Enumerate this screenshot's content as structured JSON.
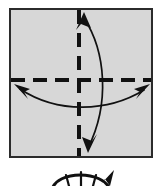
{
  "figure": {
    "caption": "Square sheet with horizontal and vertical valley creases and two double-headed curved fold arrows",
    "background_color": "#ffffff"
  },
  "paper": {
    "label": "square paper sheet",
    "shape": "square",
    "fill_color": "#d7d7d7",
    "border_color": "#2b2b2b",
    "border_width": 2,
    "x": 10,
    "y": 9,
    "width": 142,
    "height": 148
  },
  "creases": [
    {
      "name": "horizontal-crease",
      "type": "dashed",
      "orientation": "horizontal",
      "color": "#111111",
      "width": 4,
      "dash": "14 8",
      "x1": 11,
      "y1": 80,
      "x2": 151,
      "y2": 80
    },
    {
      "name": "vertical-crease",
      "type": "dashed",
      "orientation": "vertical",
      "color": "#111111",
      "width": 4,
      "dash": "14 9",
      "x1": 79,
      "y1": 10,
      "x2": 79,
      "y2": 156
    }
  ],
  "arrows": [
    {
      "name": "vertical-fold-arrow",
      "direction": "double-headed",
      "color": "#111111",
      "width": 1.7,
      "path": "M 84 18 C 106 52 110 104 88 148",
      "heads": [
        {
          "name": "arrowhead-top",
          "points": "84,12 91,28 81,24 76,30",
          "tip_x": 84,
          "tip_y": 12
        },
        {
          "name": "arrowhead-bottom",
          "points": "88,153 82,137 92,141 97,134",
          "tip_x": 88,
          "tip_y": 153
        }
      ]
    },
    {
      "name": "horizontal-fold-arrow",
      "direction": "double-headed",
      "color": "#111111",
      "width": 1.7,
      "path": "M 20 89 C 58 114 108 112 144 90",
      "heads": [
        {
          "name": "arrowhead-left",
          "points": "14,84 30,89 24,92 28,99",
          "tip_x": 14,
          "tip_y": 84
        },
        {
          "name": "arrowhead-right",
          "points": "150,84 134,89 140,92 136,99",
          "tip_x": 150,
          "tip_y": 84
        }
      ]
    }
  ],
  "next_step_preview": {
    "name": "next-step-partial",
    "description": "cropped top of following diagram: curved arc with radiating fold lines and arrowhead",
    "color": "#111111",
    "arc_path": "M 52 190 C 56 170 104 170 110 190",
    "spoke_paths": [
      "M 81 172 L 81 190",
      "M 66 175 C 68 182 69 186 70 190",
      "M 96 175 C 94 182 93 186 92 190"
    ],
    "arrowhead_points": "114,170 110,186 105,179 101,184"
  }
}
